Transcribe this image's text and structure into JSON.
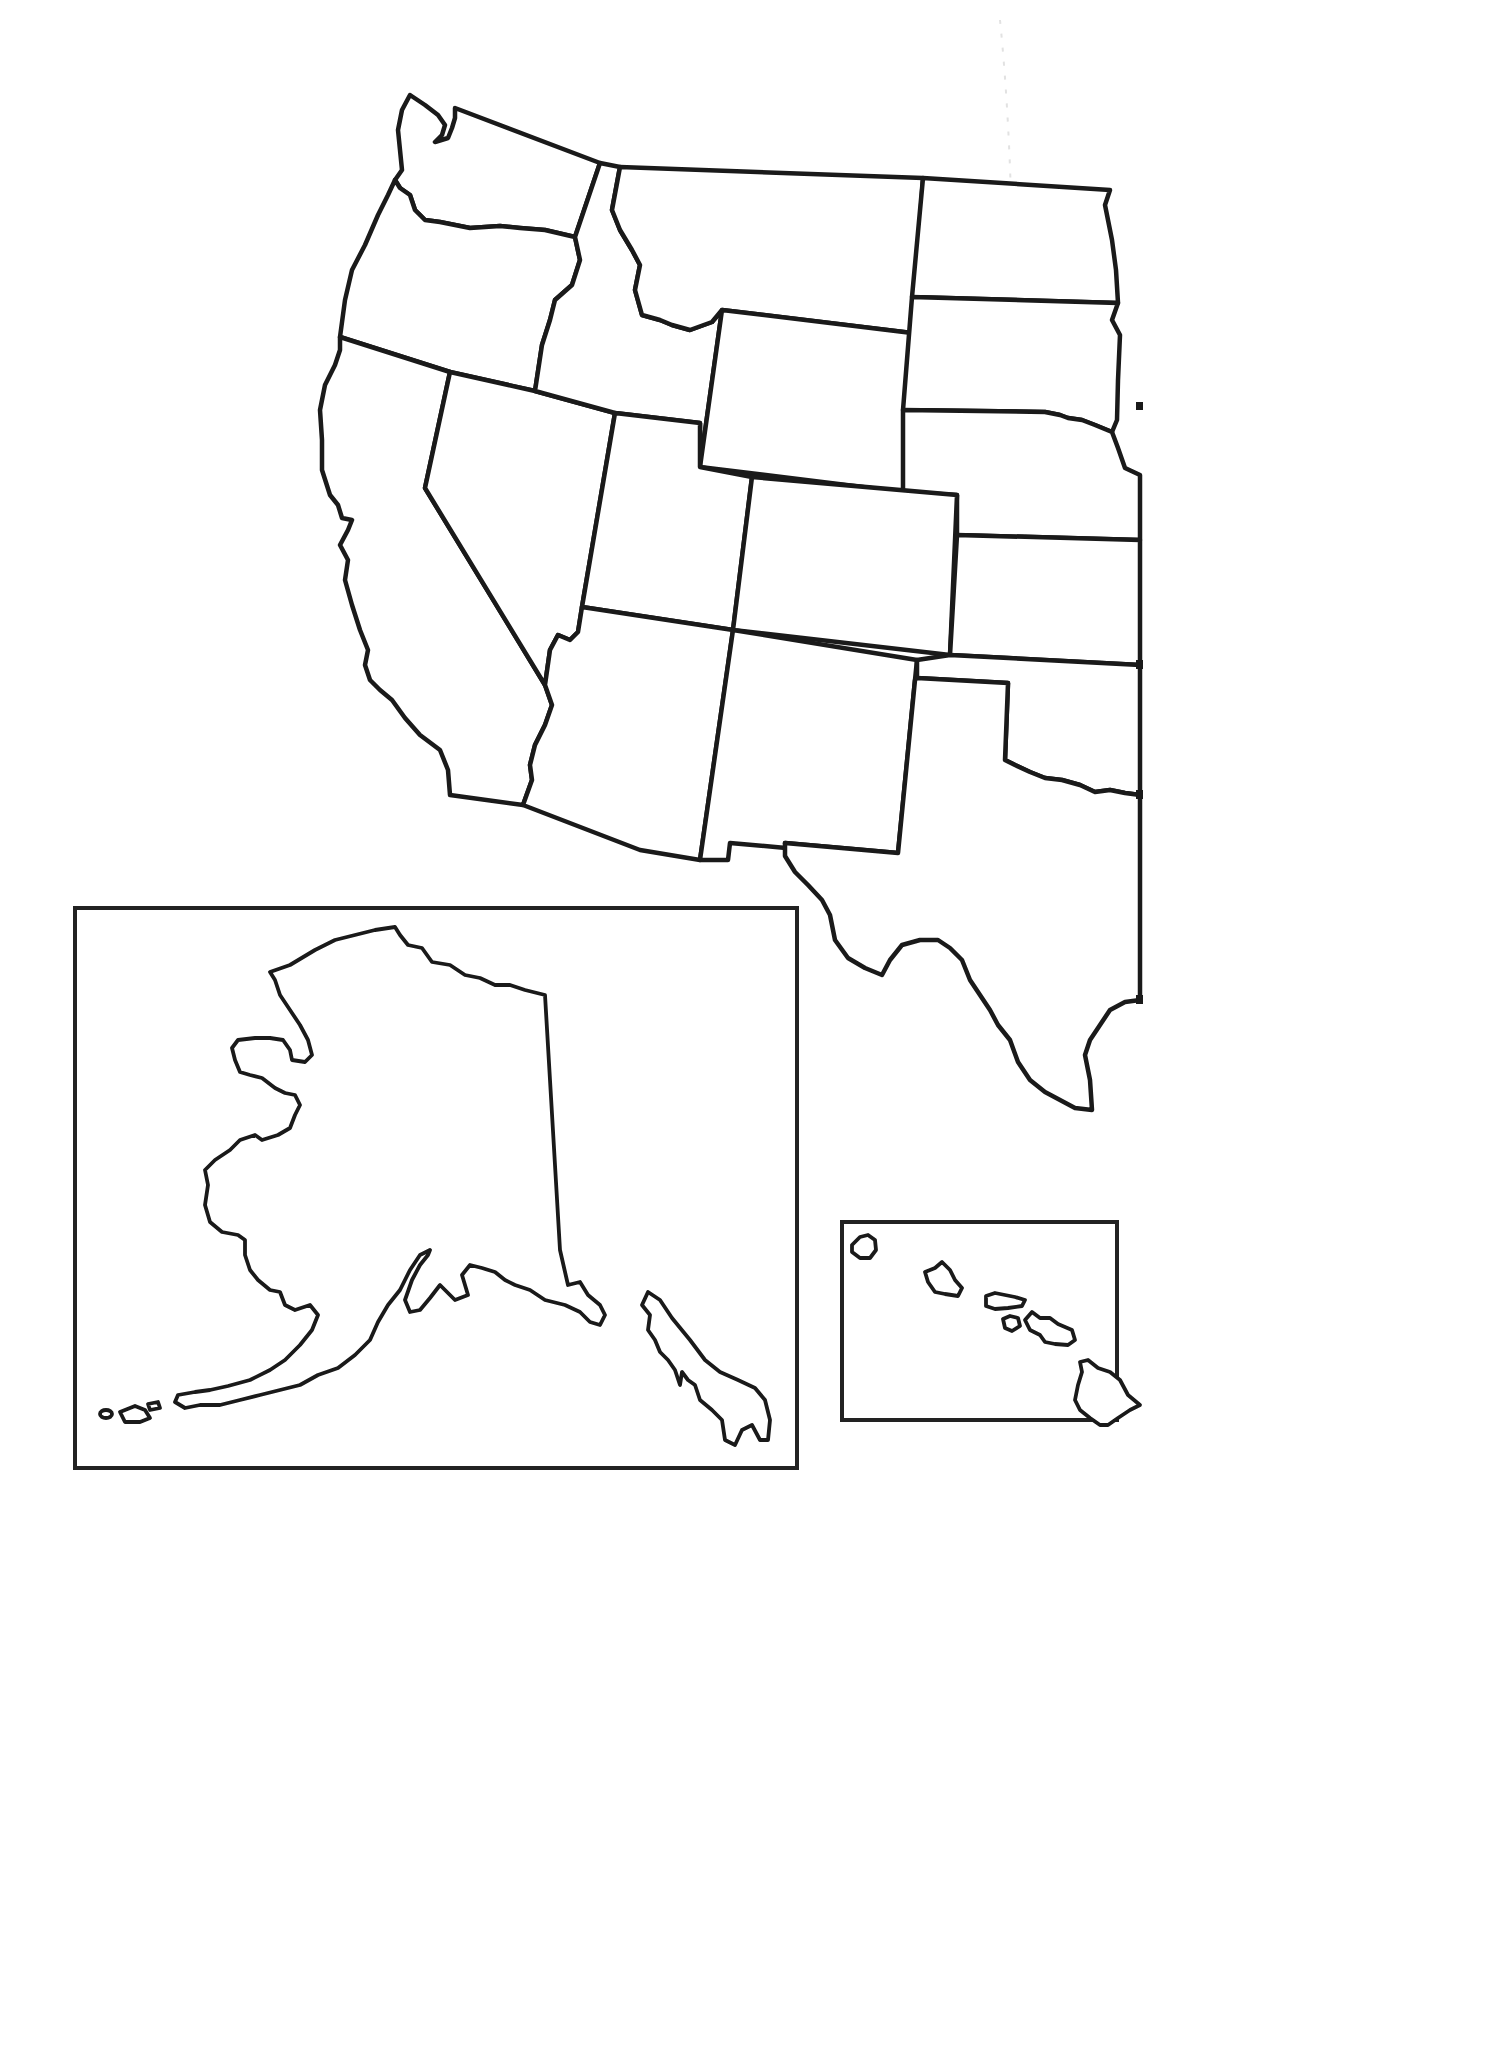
{
  "map": {
    "title": "",
    "type": "blank outline map",
    "region": "Western United States with Alaska and Hawaii insets",
    "labels_visible": false,
    "line_color": "#1a1a1a",
    "background_color": "#ffffff",
    "contiguous_states_shown": [
      "Washington",
      "Oregon",
      "California",
      "Idaho",
      "Nevada",
      "Montana",
      "Wyoming",
      "Utah",
      "Arizona",
      "Colorado",
      "New Mexico",
      "North Dakota",
      "South Dakota",
      "Nebraska",
      "Kansas",
      "Oklahoma",
      "Texas"
    ],
    "insets": [
      {
        "id": "alaska",
        "name": "Alaska"
      },
      {
        "id": "hawaii",
        "name": "Hawaii"
      }
    ]
  }
}
